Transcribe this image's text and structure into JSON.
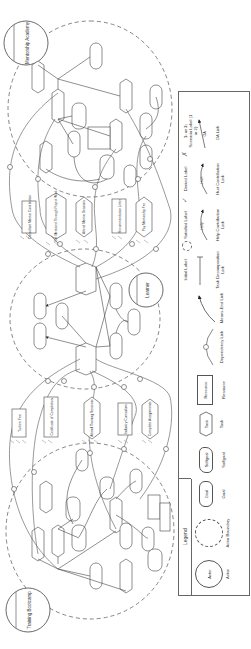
{
  "diagram": {
    "type": "iStar goal model (strategic rationale)",
    "orientation": "rotated 90 degrees counter-clockwise",
    "actors": [
      {
        "id": "training-bootcamp",
        "label": "Training Bootcamp"
      },
      {
        "id": "learner",
        "label": "Learner"
      },
      {
        "id": "mentorship-academy",
        "label": "Mentorship Academy"
      }
    ],
    "dependums": {
      "bootcamp_side": [
        {
          "kind": "resource",
          "label": "Tuition Fee"
        },
        {
          "kind": "resource",
          "label": "Certificate of Completion"
        },
        {
          "kind": "task",
          "label": "Attend Training Sessions"
        },
        {
          "kind": "resource",
          "label": "Industry Curriculum"
        },
        {
          "kind": "task",
          "label": "Complete Assignments"
        }
      ],
      "academy_side": [
        {
          "kind": "resource",
          "label": "Consultant Mentor Contribution"
        },
        {
          "kind": "task",
          "label": "Get Mentored Through Project Work"
        },
        {
          "kind": "task",
          "label": "Attend Mentor Sessions"
        },
        {
          "kind": "resource",
          "label": "Recommendation Letter"
        },
        {
          "kind": "task",
          "label": "Pay Mentorship Fee"
        }
      ]
    },
    "legend": {
      "title": "Legend",
      "items": [
        {
          "label": "Actor",
          "shape_text": "Actor"
        },
        {
          "label": "Actor Boundary",
          "shape_text": ""
        },
        {
          "label": "Goal",
          "shape_text": "Goal"
        },
        {
          "label": "Softgoal",
          "shape_text": "Softgoal"
        },
        {
          "label": "Task",
          "shape_text": "Task"
        },
        {
          "label": "Resource",
          "shape_text": "Resource"
        },
        {
          "label": "Dependency Link",
          "shape_text": "D"
        },
        {
          "label": "Means-End Link",
          "shape_text": ""
        },
        {
          "label": "Task Decomposition Link",
          "shape_text": ""
        },
        {
          "label": "Initial Label",
          "shape_text": ""
        },
        {
          "label": "Help Contribution Link",
          "shape_text": "Help"
        },
        {
          "label": "Satisfied Label",
          "shape_text": "✓"
        },
        {
          "label": "Hurt Contribution Link",
          "shape_text": "Hurt"
        },
        {
          "label": "Denied Label",
          "shape_text": "✗"
        },
        {
          "label": "OA Link",
          "shape_text": "OA"
        },
        {
          "label": "Scenario Label (1 or 2)",
          "shape_text": "1: or 2:"
        }
      ]
    },
    "colors": {
      "line": "#555555",
      "text": "#333333",
      "background": "#ffffff"
    }
  }
}
